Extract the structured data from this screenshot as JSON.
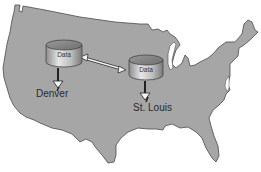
{
  "diagram": {
    "title": "",
    "map": {
      "region": "United States",
      "fill_color": "#a6a6a6",
      "outline_color": "#4a4a4a",
      "background_color": "#ffffff"
    },
    "nodes": [
      {
        "id": "db-denver",
        "icon": "database-cylinder-icon",
        "label": "Data",
        "location_label": "Denver"
      },
      {
        "id": "db-stlouis",
        "icon": "database-cylinder-icon",
        "label": "Data",
        "location_label": "St. Louis"
      }
    ],
    "edges": [
      {
        "from": "db-denver",
        "to": "db-stlouis",
        "type": "bidirectional-arrow"
      },
      {
        "from": "db-denver",
        "to": "Denver",
        "type": "down-arrow"
      },
      {
        "from": "db-stlouis",
        "to": "St. Louis",
        "type": "down-arrow"
      }
    ]
  }
}
